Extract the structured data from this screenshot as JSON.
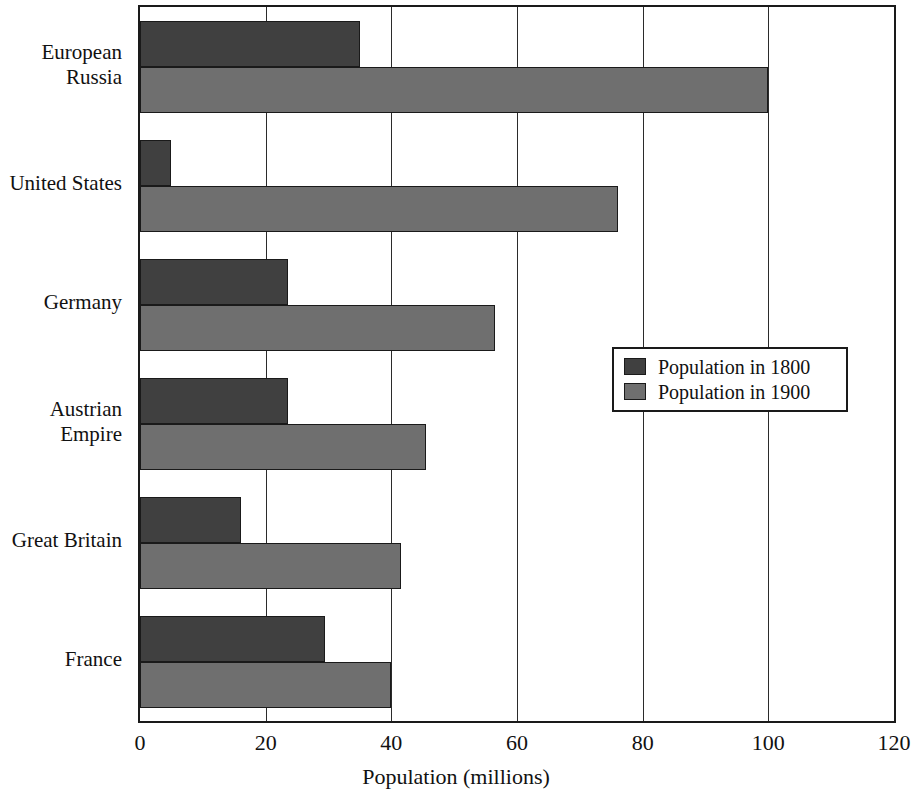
{
  "chart_data": {
    "type": "bar",
    "orientation": "horizontal",
    "title": "",
    "xlabel": "Population (millions)",
    "ylabel": "",
    "xlim": [
      0,
      120
    ],
    "xticks": [
      0,
      20,
      40,
      60,
      80,
      100,
      120
    ],
    "xtick_labels": [
      "0",
      "20",
      "40",
      "60",
      "80",
      "100",
      "120"
    ],
    "grid": true,
    "grid_axis": "x",
    "legend_position": "center-right",
    "categories": [
      "European\nRussia",
      "United States",
      "Germany",
      "Austrian\nEmpire",
      "Great Britain",
      "France"
    ],
    "series": [
      {
        "name": "Population in 1800",
        "color": "#404040",
        "values": [
          35,
          5,
          23.5,
          23.5,
          16,
          29.5
        ]
      },
      {
        "name": "Population in 1900",
        "color": "#6f6f6f",
        "values": [
          100,
          76,
          56.5,
          45.5,
          41.5,
          40
        ]
      }
    ]
  },
  "legend": {
    "items": [
      {
        "label": "Population in 1800",
        "color": "#404040"
      },
      {
        "label": "Population in 1900",
        "color": "#6f6f6f"
      }
    ]
  },
  "axis": {
    "x_title": "Population (millions)"
  }
}
